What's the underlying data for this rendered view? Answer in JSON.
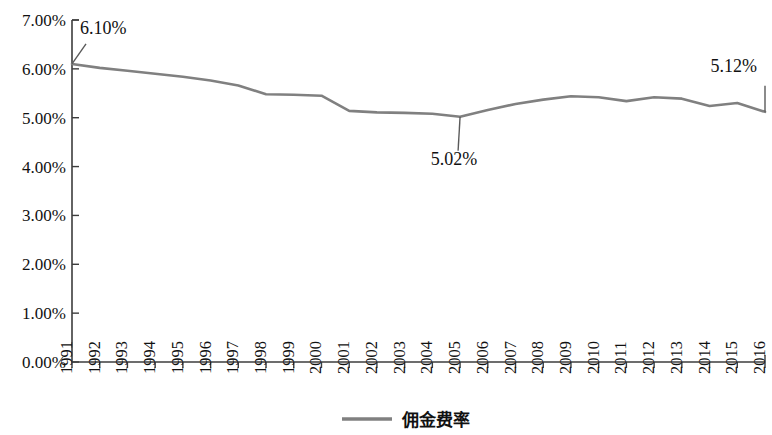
{
  "chart_data": {
    "type": "line",
    "title": "",
    "subtitle": "",
    "xlabel": "",
    "ylabel": "",
    "grid": false,
    "legend_position": "bottom-center",
    "ylim": [
      0.0,
      7.0
    ],
    "y_tick_labels": [
      "0.00%",
      "1.00%",
      "2.00%",
      "3.00%",
      "4.00%",
      "5.00%",
      "6.00%",
      "7.00%"
    ],
    "y_tick_values": [
      0.0,
      1.0,
      2.0,
      3.0,
      4.0,
      5.0,
      6.0,
      7.0
    ],
    "categories": [
      "1991",
      "1992",
      "1993",
      "1994",
      "1995",
      "1996",
      "1997",
      "1998",
      "1999",
      "2000",
      "2001",
      "2002",
      "2003",
      "2004",
      "2005",
      "2006",
      "2007",
      "2008",
      "2009",
      "2010",
      "2011",
      "2012",
      "2013",
      "2014",
      "2015",
      "2016"
    ],
    "series": [
      {
        "name": "佣金费率",
        "color": "#808080",
        "values": [
          6.1,
          6.02,
          5.96,
          5.9,
          5.84,
          5.76,
          5.66,
          5.48,
          5.47,
          5.45,
          5.14,
          5.11,
          5.1,
          5.08,
          5.02,
          5.16,
          5.28,
          5.37,
          5.44,
          5.42,
          5.34,
          5.42,
          5.39,
          5.24,
          5.3,
          5.12
        ]
      }
    ],
    "annotations": [
      {
        "label": "6.10%",
        "year": "1991",
        "value": 6.1
      },
      {
        "label": "5.02%",
        "year": "2005",
        "value": 5.02
      },
      {
        "label": "5.12%",
        "year": "2016",
        "value": 5.12
      }
    ]
  },
  "legend": {
    "entries": [
      {
        "label": "佣金费率",
        "color": "#808080"
      }
    ]
  },
  "colors": {
    "series_gray": "#808080",
    "axis": "#3d3d3d",
    "text": "#111111",
    "background": "#ffffff"
  }
}
